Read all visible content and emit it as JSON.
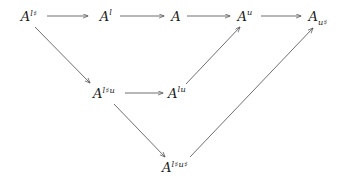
{
  "diagram": {
    "type": "commutative-diagram",
    "background_color": "#ffffff",
    "stroke_color": "#555555",
    "text_color": "#1a1a1a",
    "width": 344,
    "height": 184,
    "nodes": [
      {
        "id": "A_lsharp",
        "base": "A",
        "sup": "l♯",
        "sub": "",
        "label": "A^{l♯}",
        "x": 29,
        "y": 16
      },
      {
        "id": "A_l",
        "base": "A",
        "sup": "l",
        "sub": "",
        "label": "A^{l}",
        "x": 106,
        "y": 16
      },
      {
        "id": "A",
        "base": "A",
        "sup": "",
        "sub": "",
        "label": "A",
        "x": 176,
        "y": 16
      },
      {
        "id": "A_u",
        "base": "A",
        "sup": "u",
        "sub": "",
        "label": "A^{u}",
        "x": 245,
        "y": 16
      },
      {
        "id": "A_sub_usharp",
        "base": "A",
        "sup": "",
        "sub": "u♯",
        "label": "A_{u♯}",
        "x": 318,
        "y": 16
      },
      {
        "id": "A_lsharpu",
        "base": "A",
        "sup": "l♯u",
        "sub": "",
        "label": "A^{l♯u}",
        "x": 104,
        "y": 93
      },
      {
        "id": "A_lu",
        "base": "A",
        "sup": "lu",
        "sub": "",
        "label": "A^{lu}",
        "x": 177,
        "y": 93
      },
      {
        "id": "A_lsharpusharp",
        "base": "A",
        "sup": "l♯u♯",
        "sub": "",
        "label": "A^{l♯u♯}",
        "x": 175,
        "y": 167
      }
    ],
    "arrows": [
      {
        "id": "arrow-lsharp-to-l",
        "from": "A_lsharp",
        "to": "A_l",
        "x1": 47,
        "y1": 16,
        "x2": 88,
        "y2": 16,
        "kind": "horizontal"
      },
      {
        "id": "arrow-l-to-A",
        "from": "A_l",
        "to": "A",
        "x1": 120,
        "y1": 16,
        "x2": 164,
        "y2": 16,
        "kind": "horizontal"
      },
      {
        "id": "arrow-A-to-u",
        "from": "A",
        "to": "A_u",
        "x1": 187,
        "y1": 16,
        "x2": 230,
        "y2": 16,
        "kind": "horizontal"
      },
      {
        "id": "arrow-u-to-subusharp",
        "from": "A_u",
        "to": "A_sub_usharp",
        "x1": 261,
        "y1": 16,
        "x2": 301,
        "y2": 16,
        "kind": "horizontal"
      },
      {
        "id": "arrow-lsharp-to-lsharpu",
        "from": "A_lsharp",
        "to": "A_lsharpu",
        "x1": 35,
        "y1": 27,
        "x2": 90,
        "y2": 83,
        "kind": "diagonal-down"
      },
      {
        "id": "arrow-lsharpu-to-lu",
        "from": "A_lsharpu",
        "to": "A_lu",
        "x1": 125,
        "y1": 93,
        "x2": 163,
        "y2": 93,
        "kind": "horizontal"
      },
      {
        "id": "arrow-lsharpu-to-u",
        "from": "A_lsharpu",
        "to": "A_u",
        "x1": 186,
        "y1": 84,
        "x2": 240,
        "y2": 27,
        "kind": "diagonal-up"
      },
      {
        "id": "arrow-lsharpu-to-lsharpusharp",
        "from": "A_lsharpu",
        "to": "A_lsharpusharp",
        "x1": 114,
        "y1": 104,
        "x2": 165,
        "y2": 157,
        "kind": "diagonal-down"
      },
      {
        "id": "arrow-lsharpusharp-to-subusharp",
        "from": "A_lsharpusharp",
        "to": "A_sub_usharp",
        "x1": 190,
        "y1": 157,
        "x2": 313,
        "y2": 28,
        "kind": "diagonal-up"
      }
    ]
  }
}
